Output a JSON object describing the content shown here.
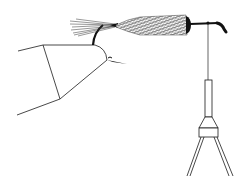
{
  "illustration": {
    "subject": "fly tying: hook clamped in vise jaw with tail, wrapped body and hanging bobbin",
    "colors": {
      "background": "#ffffff",
      "ink": "#1a1a1a"
    },
    "parts": [
      {
        "name": "vise-jaw",
        "label": "vise jaw"
      },
      {
        "name": "hook",
        "label": "hook"
      },
      {
        "name": "tail",
        "label": "tail fibers"
      },
      {
        "name": "body",
        "label": "wrapped body"
      },
      {
        "name": "head",
        "label": "thread head"
      },
      {
        "name": "hook-eye",
        "label": "hook eye"
      },
      {
        "name": "thread",
        "label": "tying thread"
      },
      {
        "name": "bobbin",
        "label": "bobbin holder"
      }
    ]
  }
}
